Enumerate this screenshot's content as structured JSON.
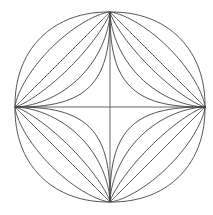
{
  "figure": {
    "background_color": "#ffffff",
    "curve_color": "#3a3a3a",
    "axis_color": "#555555",
    "line_width": 0.9,
    "width": 213,
    "height": 215
  },
  "chart_data": {
    "type": "line",
    "subtitle": "",
    "xlabel": "",
    "ylabel": "",
    "xlim": [
      -1,
      1
    ],
    "ylim": [
      -1,
      1
    ],
    "grid": false,
    "legend_position": "none",
    "equation": "|x/a|^n + |y/b|^n = 1",
    "center": [
      110,
      107
    ],
    "semi_axis_x": 95,
    "semi_axis_y": 95,
    "vertices": {
      "top": [
        110,
        12
      ],
      "right": [
        205,
        107
      ],
      "bottom": [
        110,
        202
      ],
      "left": [
        15,
        107
      ]
    },
    "axes": [
      {
        "name": "horizontal-axis",
        "x1": 15,
        "y1": 107,
        "x2": 205,
        "y2": 107
      },
      {
        "name": "vertical-axis",
        "x1": 110,
        "y1": 12,
        "x2": 110,
        "y2": 202
      }
    ],
    "series": [
      {
        "name": "n = 0.45",
        "exponent": 0.45,
        "shape": "concave astroid",
        "sample_at_45deg": 0.088
      },
      {
        "name": "n = 0.60",
        "exponent": 0.6,
        "shape": "concave",
        "sample_at_45deg": 0.158
      },
      {
        "name": "n = 0.80",
        "exponent": 0.8,
        "shape": "slightly concave",
        "sample_at_45deg": 0.26
      },
      {
        "name": "n = 1.00",
        "exponent": 1.0,
        "shape": "rhombus",
        "sample_at_45deg": 0.354
      },
      {
        "name": "n = 1.45",
        "exponent": 1.45,
        "shape": "convex",
        "sample_at_45deg": 0.441
      },
      {
        "name": "n = 2.20",
        "exponent": 2.2,
        "shape": "convex ellipse-like",
        "sample_at_45deg": 0.523
      }
    ]
  }
}
